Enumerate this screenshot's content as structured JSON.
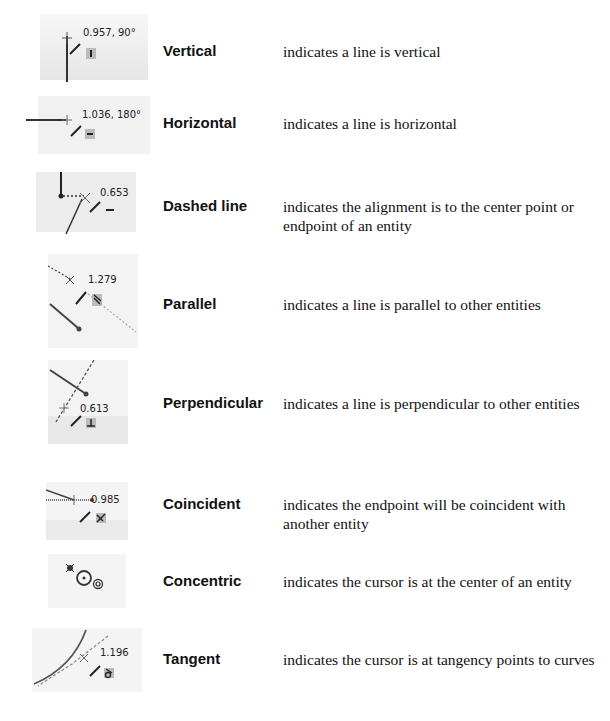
{
  "rows": [
    {
      "term": "Vertical",
      "description": "indicates a line is vertical",
      "readout": "0.957, 90°",
      "icon": "vertical-relation-icon"
    },
    {
      "term": "Horizontal",
      "description": "indicates a line is horizontal",
      "readout": "1.036, 180°",
      "icon": "horizontal-relation-icon"
    },
    {
      "term": "Dashed line",
      "description": "indicates the alignment is to the center point or endpoint of an entity",
      "readout": "0.653",
      "icon": "dashed-inference-line-icon"
    },
    {
      "term": "Parallel",
      "description": "indicates a line is parallel to other entities",
      "readout": "1.279",
      "icon": "parallel-relation-icon"
    },
    {
      "term": "Perpendicular",
      "description": "indicates a line is perpendicular to other entities",
      "readout": "0.613",
      "icon": "perpendicular-relation-icon"
    },
    {
      "term": "Coincident",
      "description": "indicates the endpoint will be coincident with another entity",
      "readout": "0.985",
      "icon": "coincident-relation-icon"
    },
    {
      "term": "Concentric",
      "description": "indicates the cursor is at the center of an entity",
      "readout": "",
      "icon": "concentric-relation-icon"
    },
    {
      "term": "Tangent",
      "description": "indicates the cursor is at tangency points to curves",
      "readout": "1.196",
      "icon": "tangent-relation-icon"
    }
  ]
}
